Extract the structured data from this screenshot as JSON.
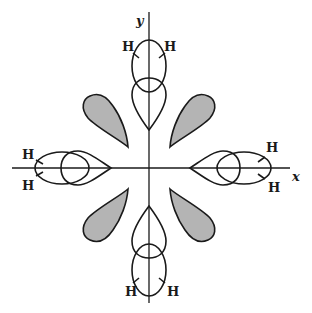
{
  "diagram": {
    "title": "",
    "axes": {
      "x_label": "x",
      "y_label": "y"
    },
    "atom_labels": {
      "top_left": "H",
      "top_right": "H",
      "left_upper": "H",
      "left_lower": "H",
      "right_upper": "H",
      "right_lower": "H",
      "bottom_left": "H",
      "bottom_right": "H"
    },
    "components": [
      "4 bonding orbital pairs along +x, -x, +y, -y axes (ellipse overlapping a teardrop lobe)",
      "4 shaded teardrop lobes along diagonals"
    ],
    "colors": {
      "stroke": "#1a1a1a",
      "shaded_fill": "#b4b4b4",
      "background": "#ffffff"
    }
  }
}
